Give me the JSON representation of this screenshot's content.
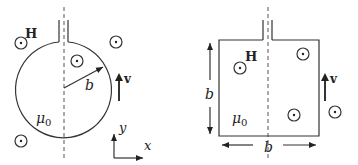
{
  "figures": {
    "left": {
      "shape": "circular-loop",
      "field_label": "H",
      "radius_label": "b",
      "velocity_label": "v",
      "permeability_label": "μ",
      "permeability_subscript": "0",
      "axes": {
        "x_label": "x",
        "y_label": "y"
      },
      "field_symbols": [
        "out-of-page",
        "out-of-page",
        "out-of-page",
        "out-of-page"
      ]
    },
    "right": {
      "shape": "square-loop",
      "field_label": "H",
      "side_vertical_label": "b",
      "side_horizontal_label": "b",
      "velocity_label": "v",
      "permeability_label": "μ",
      "permeability_subscript": "0",
      "field_symbols": [
        "out-of-page",
        "out-of-page",
        "out-of-page",
        "out-of-page"
      ]
    }
  },
  "colors": {
    "line": "#333333",
    "dash": "#555555",
    "text": "#222222"
  }
}
